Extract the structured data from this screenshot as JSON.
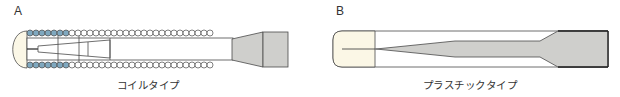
{
  "panels": [
    {
      "id": "A",
      "label": "A",
      "caption": "コイルタイプ",
      "description": "coil type"
    },
    {
      "id": "B",
      "label": "B",
      "caption": "プラスチックタイプ",
      "description": "plastic type"
    }
  ],
  "colors": {
    "outline": "#4a4a4a",
    "cap_fill": "#fbf7e6",
    "coil_blue": "#7fa8bf",
    "coil_white": "#ffffff",
    "handle_gray": "#cfcfcc"
  }
}
